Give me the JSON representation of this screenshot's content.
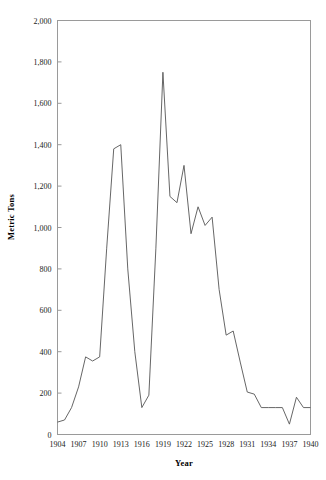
{
  "chart_data": {
    "type": "line",
    "title": "",
    "xlabel": "Year",
    "ylabel": "Metric Tons",
    "xlim": [
      1904,
      1940
    ],
    "ylim": [
      0,
      2000
    ],
    "grid": false,
    "legend": null,
    "x_tick_labels": [
      "1904",
      "1907",
      "1910",
      "1913",
      "1916",
      "1919",
      "1922",
      "1925",
      "1928",
      "1931",
      "1934",
      "1937",
      "1940"
    ],
    "x_ticks": [
      1904,
      1907,
      1910,
      1913,
      1916,
      1919,
      1922,
      1925,
      1928,
      1931,
      1934,
      1937,
      1940
    ],
    "y_tick_labels": [
      "0",
      "200",
      "400",
      "600",
      "800",
      "1,000",
      "1,200",
      "1,400",
      "1,600",
      "1,800",
      "2,000"
    ],
    "y_ticks": [
      0,
      200,
      400,
      600,
      800,
      1000,
      1200,
      1400,
      1600,
      1800,
      2000
    ],
    "line_color": "#555555",
    "x": [
      1904,
      1905,
      1906,
      1907,
      1908,
      1909,
      1910,
      1911,
      1912,
      1913,
      1914,
      1915,
      1916,
      1917,
      1918,
      1919,
      1920,
      1921,
      1922,
      1923,
      1924,
      1925,
      1926,
      1927,
      1928,
      1929,
      1930,
      1931,
      1932,
      1933,
      1934,
      1935,
      1936,
      1937,
      1938,
      1939,
      1940
    ],
    "values": [
      60,
      70,
      130,
      230,
      375,
      355,
      375,
      900,
      1380,
      1400,
      800,
      400,
      130,
      190,
      900,
      1750,
      1150,
      1120,
      1300,
      970,
      1100,
      1010,
      1050,
      700,
      480,
      500,
      350,
      205,
      195,
      130,
      130,
      130,
      130,
      50,
      180,
      130,
      130
    ],
    "series": [
      {
        "name": "Metric Tons",
        "values": [
          60,
          70,
          130,
          230,
          375,
          355,
          375,
          900,
          1380,
          1400,
          800,
          400,
          130,
          190,
          900,
          1750,
          1150,
          1120,
          1300,
          970,
          1100,
          1010,
          1050,
          700,
          480,
          500,
          350,
          205,
          195,
          130,
          130,
          130,
          130,
          50,
          180,
          130,
          130
        ]
      }
    ]
  },
  "axis": {
    "xlabel": "Year",
    "ylabel": "Metric Tons"
  }
}
